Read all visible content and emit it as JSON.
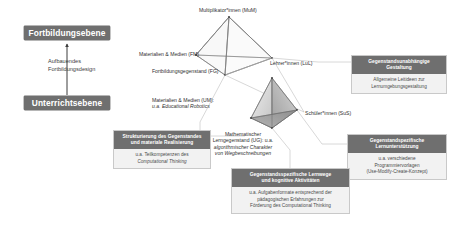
{
  "levels": {
    "further_training": "Fortbildungsebene",
    "instruction": "Unterrichtsebene",
    "arrow_caption_line1": "Aufbauendes",
    "arrow_caption_line2": "Fortbildungsdesign"
  },
  "upper_tetrahedron": {
    "name": "Fortbildungsebene-Tetraeder",
    "vertices": [
      {
        "id": "mum",
        "label": "Multiplikator*innen (MuM)"
      },
      {
        "id": "fm",
        "label": "Materialien & Medien (FM)"
      },
      {
        "id": "fg",
        "label": "Fortbildungsgegenstand (FG)"
      },
      {
        "id": "lul",
        "label": "Lehrer*innen (LuL)"
      }
    ]
  },
  "lower_tetrahedron": {
    "name": "Unterrichtsebene-Tetraeder",
    "vertices": [
      {
        "id": "lul2",
        "label": "Lehrer*innen (LuL)"
      },
      {
        "id": "um",
        "label_main": "Materialien & Medien (UM):",
        "label_sub": "u.a. Educational Robotics"
      },
      {
        "id": "ug",
        "label_main": "Mathematischer",
        "label_mid": "Lerngegenstand (UG): u.a.",
        "label_sub": "algorithmischer Charakter",
        "label_sub2": "von Wegbeschreibungen"
      },
      {
        "id": "sus",
        "label": "Schüler*innen (SuS)"
      }
    ]
  },
  "callouts": {
    "gestaltung": {
      "title_line1": "Gegenstandsunabhängige",
      "title_line2": "Gestaltung",
      "body_line1": "Allgemeine Leitideen zur",
      "body_line2": "Lernumgebungsgestaltung"
    },
    "strukturierung": {
      "title_line1": "Strukturierung des Gegenstandes",
      "title_line2": "und materiale Realisierung",
      "body_line1": "u.a. Teilkompetenzen des",
      "body_line2": "Computational Thinking"
    },
    "lernunterstuetzung": {
      "title_line1": "Gegenstandspezifische",
      "title_line2": "Lernunterstützung",
      "body_line1": "u.a. verschiedene",
      "body_line2": "Programmiervorlagen",
      "body_line3": "(Use-Modify-Create-Konzept)"
    },
    "lernwege": {
      "title_line1": "Gegenstandsspezifische Lernwege",
      "title_line2": "und kognitive Aktivitäten",
      "body_line1": "u.a. Aufgabenformate entsprechend der",
      "body_line2": "pädagogischen Erfahrungen zur",
      "body_line3": "Förderung des Computational Thinking"
    }
  },
  "colors": {
    "banner": "#6f6f6f",
    "callout_bg": "#f2f2f2",
    "callout_border": "#c9c9c9",
    "edge": "#6e6e6e",
    "face_light": "#e3e3e3",
    "face_mid": "#bfbfbf",
    "face_dark": "#9a9a9a",
    "text": "#3d3d3d"
  }
}
